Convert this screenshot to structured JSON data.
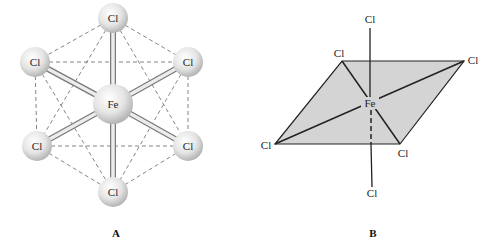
{
  "figure": {
    "panel_a": {
      "caption": "A",
      "title": "Ball-and-stick octahedral FeCl6",
      "center_atom": "Fe",
      "ligands": [
        "Cl",
        "Cl",
        "Cl",
        "Cl",
        "Cl",
        "Cl"
      ]
    },
    "panel_b": {
      "caption": "B",
      "title": "Octahedral geometry with equatorial plane",
      "center_atom": "Fe",
      "ligands": [
        "Cl",
        "Cl",
        "Cl",
        "Cl",
        "Cl",
        "Cl"
      ]
    },
    "colors": {
      "atom_fill": "#e6e6e6",
      "plane_fill": "#d4d4d4",
      "line": "#222222",
      "dashed": "#555555"
    }
  }
}
